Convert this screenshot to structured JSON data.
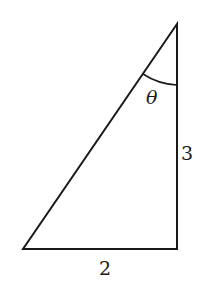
{
  "diagram": {
    "type": "right-triangle",
    "labels": {
      "angle": "θ",
      "vertical_side": "3",
      "horizontal_side": "2"
    },
    "colors": {
      "stroke": "#1a1a1a",
      "background": "#ffffff"
    }
  }
}
